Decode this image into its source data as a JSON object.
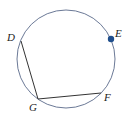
{
  "diagram": {
    "type": "circle-inscribed-angle",
    "circle": {
      "cx": 66,
      "cy": 59,
      "r": 49,
      "stroke": "#5a6a8a"
    },
    "points": [
      {
        "id": "D",
        "label": "D",
        "x": 21,
        "y": 41,
        "label_x": 7,
        "label_y": 41
      },
      {
        "id": "E",
        "label": "E",
        "x": 111,
        "y": 39,
        "label_x": 115,
        "label_y": 37,
        "marked": true,
        "color": "#1f4e8c"
      },
      {
        "id": "F",
        "label": "F",
        "x": 101,
        "y": 93,
        "label_x": 104,
        "label_y": 101
      },
      {
        "id": "G",
        "label": "G",
        "x": 38,
        "y": 99,
        "label_x": 29,
        "label_y": 111
      }
    ],
    "segments": [
      {
        "from": "D",
        "to": "G"
      },
      {
        "from": "G",
        "to": "F"
      }
    ],
    "line_color": "#333333"
  }
}
